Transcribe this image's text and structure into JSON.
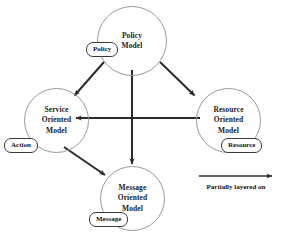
{
  "diagram": {
    "nodes": [
      {
        "id": "policy-model",
        "label_line1": "Policy",
        "label_line2": "Model",
        "tag": "Policy"
      },
      {
        "id": "service-oriented-model",
        "label_line1": "Service",
        "label_line2": "Oriented",
        "label_line3": "Model",
        "tag": "Action"
      },
      {
        "id": "resource-oriented-model",
        "label_line1": "Resource",
        "label_line2": "Oriented",
        "label_line3": "Model",
        "tag": "Resource"
      },
      {
        "id": "message-oriented-model",
        "label_line1": "Message",
        "label_line2": "Oriented",
        "label_line3": "Model",
        "tag": "Message"
      }
    ],
    "edges": [
      {
        "from": "policy-model",
        "to": "service-oriented-model",
        "relation": "Partially layered on"
      },
      {
        "from": "policy-model",
        "to": "resource-oriented-model",
        "relation": "Partially layered on"
      },
      {
        "from": "policy-model",
        "to": "message-oriented-model",
        "relation": "Partially layered on"
      },
      {
        "from": "resource-oriented-model",
        "to": "service-oriented-model",
        "relation": "Partially layered on"
      },
      {
        "from": "service-oriented-model",
        "to": "message-oriented-model",
        "relation": "Partially layered on"
      }
    ],
    "legend": {
      "caption": "Partially layered on",
      "symbol": "arrow-icon"
    },
    "colors": {
      "circle_stroke": "#9a9a9a",
      "arrow": "#2b2b2b",
      "tag_stroke": "#3a3a3a",
      "text": "#111111",
      "background": "#ffffff"
    }
  }
}
